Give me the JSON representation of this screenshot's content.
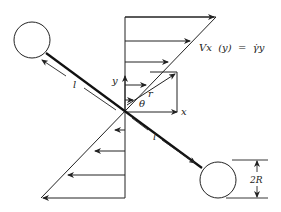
{
  "diagram": {
    "labels": {
      "rod_length_upper": "l",
      "rod_length_lower": "l",
      "axis_y": "y",
      "axis_x": "x",
      "radius_vector": "r",
      "angle": "θ",
      "velocity_equation": "Vx  (y)  =  γ̇y",
      "diameter": "2R"
    },
    "colors": {
      "line": "#222222",
      "background": "#ffffff"
    }
  }
}
